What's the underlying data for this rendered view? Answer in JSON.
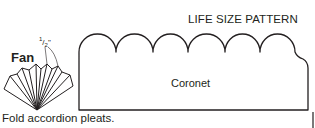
{
  "title": "LIFE SIZE PATTERN",
  "fan": {
    "label": "Fan",
    "measure_num": "1",
    "measure_sep": "/",
    "measure_den": "2",
    "measure_unit": "\""
  },
  "coronet": {
    "label": "Coronet",
    "scallop_count": 6
  },
  "caption": "Fold accordion pleats.",
  "colors": {
    "line": "#231f20",
    "background": "#ffffff"
  }
}
